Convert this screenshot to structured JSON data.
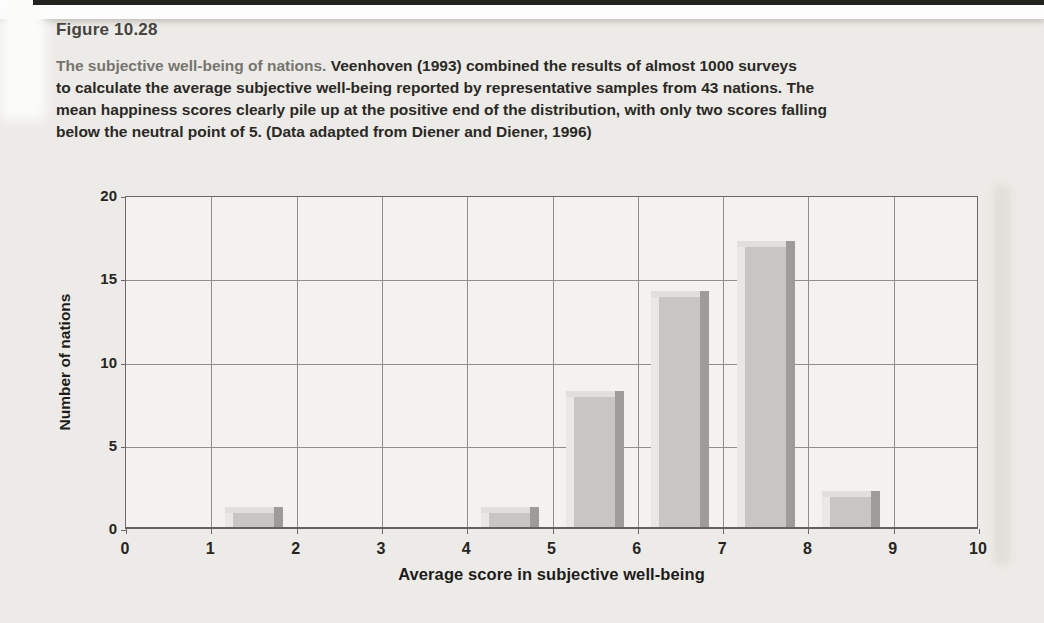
{
  "figure": {
    "label": "Figure 10.28"
  },
  "caption": {
    "lead": "The subjective well-being of nations.",
    "line1_rest": " Veenhoven (1993) combined the results of almost 1000 surveys",
    "line2": "to calculate the average subjective well-being reported by representative samples from 43 nations. The",
    "line3": "mean happiness scores clearly pile up at the positive end of the distribution, with only two scores falling",
    "line4": "below the neutral point of 5. (Data adapted from Diener and Diener, 1996)"
  },
  "chart_data": {
    "type": "bar",
    "title": "",
    "xlabel": "Average score in subjective well-being",
    "ylabel": "Number of nations",
    "bins": [
      [
        1,
        2
      ],
      [
        4,
        5
      ],
      [
        5,
        6
      ],
      [
        6,
        7
      ],
      [
        7,
        8
      ],
      [
        8,
        9
      ]
    ],
    "values": [
      1,
      1,
      8,
      14,
      17,
      2
    ],
    "total_nations": 43,
    "xlim": [
      0,
      10
    ],
    "ylim": [
      0,
      20
    ],
    "xticks": [
      0,
      1,
      2,
      3,
      4,
      5,
      6,
      7,
      8,
      9,
      10
    ],
    "yticks": [
      0,
      5,
      10,
      15,
      20
    ],
    "grid": true,
    "legend": "none",
    "bar_span": {
      "offset_in_bin": 0.16,
      "width_in_bin": 0.68
    },
    "colors": {
      "bar_face": "#c7c6c3",
      "bar_highlight": "#e9e8e5",
      "bar_shadow": "#9d9c99",
      "bar_cap": "#e0dfdc",
      "grid": "#8f8e8a",
      "border": "#6b6a66",
      "plot_bg": "#f3f2ee",
      "page_bg": "#edebe7",
      "text": "#262522",
      "caption_lead": "#76756f"
    }
  }
}
